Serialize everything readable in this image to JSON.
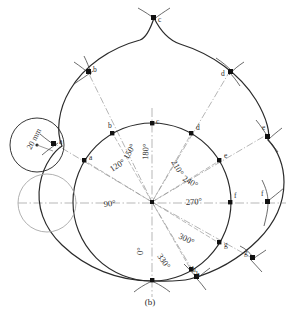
{
  "figure": {
    "caption": "(b)",
    "dimension_label": "20 mm",
    "type": "geometric-construction"
  },
  "angles": [
    {
      "label": "0°",
      "deg": 0
    },
    {
      "label": "90°",
      "deg": 90
    },
    {
      "label": "120°",
      "deg": 120
    },
    {
      "label": "150°",
      "deg": 150
    },
    {
      "label": "180°",
      "deg": 180
    },
    {
      "label": "210°",
      "deg": 210
    },
    {
      "label": "240°",
      "deg": 240
    },
    {
      "label": "270°",
      "deg": 270
    },
    {
      "label": "300°",
      "deg": 300
    },
    {
      "label": "330°",
      "deg": 330
    }
  ],
  "inner_points": [
    {
      "label": "a"
    },
    {
      "label": "b"
    },
    {
      "label": "c"
    },
    {
      "label": "d"
    },
    {
      "label": "e"
    },
    {
      "label": "f"
    },
    {
      "label": "g"
    },
    {
      "label": "h"
    }
  ],
  "outer_points": [
    {
      "label": "a"
    },
    {
      "label": "b"
    },
    {
      "label": "c"
    },
    {
      "label": "d"
    },
    {
      "label": "e"
    },
    {
      "label": "f"
    },
    {
      "label": "g"
    },
    {
      "label": "h"
    }
  ],
  "colors": {
    "ink": "#2b2b2b",
    "construction": "#8d8d8d",
    "centerline": "#9a9a9a"
  }
}
